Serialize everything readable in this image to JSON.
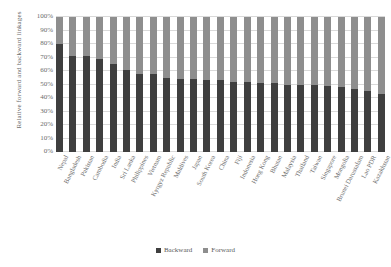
{
  "chart_data": {
    "type": "bar",
    "subtype": "stacked-100-percent",
    "title": "",
    "xlabel": "",
    "ylabel": "Relative forward and backward linkages",
    "ylim": [
      0,
      100
    ],
    "yticks": [
      "0%",
      "10%",
      "20%",
      "30%",
      "40%",
      "50%",
      "60%",
      "70%",
      "80%",
      "90%",
      "100%"
    ],
    "grid": true,
    "legend_position": "bottom",
    "categories": [
      "Nepal",
      "Bangladesh",
      "Pakistan",
      "Cambodia",
      "India",
      "Sri Lanka",
      "Philippines",
      "Vietnam",
      "Kyrgyz Republic",
      "Maldives",
      "Japan",
      "South Korea",
      "China",
      "Fiji",
      "Indonesia",
      "Hong Kong",
      "Bhutan",
      "Malaysia",
      "Thailand",
      "Taiwan",
      "Singapore",
      "Mongolia",
      "Brunei Darussalam",
      "Lao PDR",
      "Kazakhstan"
    ],
    "series": [
      {
        "name": "Backward",
        "color": "#3f3f3f",
        "values": [
          80,
          71,
          71,
          69,
          65,
          61,
          58,
          58,
          55,
          54,
          54,
          53,
          53,
          52,
          52,
          51,
          51,
          50,
          50,
          50,
          49,
          48,
          47,
          45,
          43
        ]
      },
      {
        "name": "Forward",
        "color": "#8e8e8e",
        "values": [
          20,
          29,
          29,
          31,
          35,
          39,
          42,
          42,
          45,
          46,
          46,
          47,
          47,
          48,
          48,
          49,
          49,
          50,
          50,
          50,
          51,
          52,
          53,
          55,
          57
        ]
      }
    ]
  },
  "legend": {
    "items": [
      {
        "label": "Backward"
      },
      {
        "label": "Forward"
      }
    ]
  }
}
